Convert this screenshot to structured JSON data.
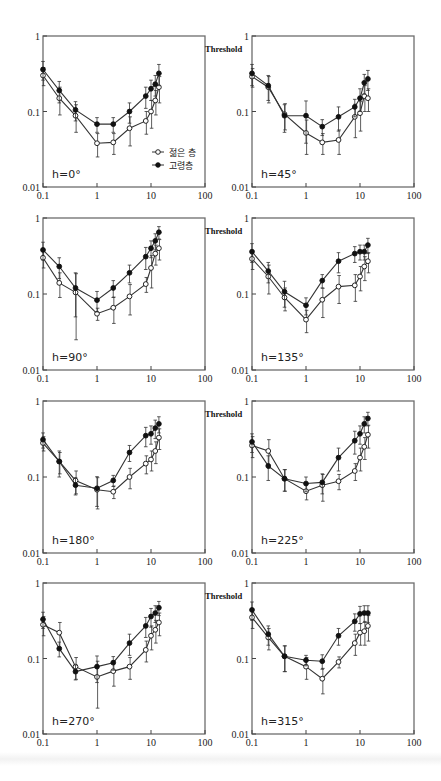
{
  "figure": {
    "legend": {
      "young_label": "젊은 층",
      "old_label": "고령층"
    },
    "y_axis_side_label": "Threshold",
    "x_tick_labels": [
      "0.1",
      "1",
      "10",
      "100"
    ],
    "y_tick_labels": [
      "0.01",
      "0.1",
      "1"
    ]
  },
  "chart_data": [
    {
      "type": "line",
      "title": "h=0°",
      "xscale": "log",
      "yscale": "log",
      "xlim": [
        0.1,
        100
      ],
      "ylim": [
        0.01,
        1
      ],
      "ylabel": "Threshold",
      "xlabel": "",
      "x": [
        0.1,
        0.2,
        0.4,
        1,
        2,
        4,
        8,
        10,
        12,
        14
      ],
      "series": [
        {
          "name": "젊은 층",
          "marker": "open-circle",
          "values": [
            0.3,
            0.15,
            0.088,
            0.038,
            0.039,
            0.06,
            0.075,
            0.1,
            0.14,
            0.21
          ],
          "err": [
            0.08,
            0.06,
            0.035,
            0.013,
            0.012,
            0.025,
            0.025,
            0.04,
            0.05,
            0.08
          ]
        },
        {
          "name": "고령층",
          "marker": "filled-circle",
          "values": [
            0.36,
            0.19,
            0.105,
            0.068,
            0.068,
            0.1,
            0.16,
            0.2,
            0.23,
            0.32
          ],
          "err": [
            0.1,
            0.06,
            0.03,
            0.015,
            0.015,
            0.03,
            0.05,
            0.06,
            0.07,
            0.1
          ]
        }
      ]
    },
    {
      "type": "line",
      "title": "h=45°",
      "xscale": "log",
      "yscale": "log",
      "xlim": [
        0.1,
        100
      ],
      "ylim": [
        0.01,
        1
      ],
      "ylabel": "Threshold",
      "xlabel": "",
      "x": [
        0.1,
        0.2,
        0.4,
        1,
        2,
        4,
        8,
        10,
        12,
        14
      ],
      "series": [
        {
          "name": "젊은 층",
          "marker": "open-circle",
          "values": [
            0.29,
            0.21,
            0.092,
            0.052,
            0.039,
            0.042,
            0.085,
            0.095,
            0.16,
            0.15
          ],
          "err": [
            0.08,
            0.08,
            0.035,
            0.025,
            0.012,
            0.015,
            0.04,
            0.04,
            0.06,
            0.05
          ]
        },
        {
          "name": "고령층",
          "marker": "filled-circle",
          "values": [
            0.32,
            0.22,
            0.088,
            0.088,
            0.063,
            0.085,
            0.115,
            0.15,
            0.24,
            0.27
          ],
          "err": [
            0.1,
            0.08,
            0.035,
            0.05,
            0.015,
            0.03,
            0.03,
            0.05,
            0.07,
            0.08
          ]
        }
      ]
    },
    {
      "type": "line",
      "title": "h=90°",
      "xscale": "log",
      "yscale": "log",
      "xlim": [
        0.1,
        100
      ],
      "ylim": [
        0.01,
        1
      ],
      "ylabel": "Threshold",
      "xlabel": "",
      "x": [
        0.1,
        0.2,
        0.4,
        1,
        2,
        4,
        8,
        10,
        12,
        14
      ],
      "series": [
        {
          "name": "젊은 층",
          "marker": "open-circle",
          "values": [
            0.3,
            0.14,
            0.105,
            0.055,
            0.066,
            0.093,
            0.135,
            0.22,
            0.34,
            0.4
          ],
          "err": [
            0.08,
            0.05,
            0.08,
            0.01,
            0.025,
            0.04,
            0.03,
            0.1,
            0.1,
            0.12
          ]
        },
        {
          "name": "고령층",
          "marker": "filled-circle",
          "values": [
            0.38,
            0.23,
            0.12,
            0.083,
            0.12,
            0.19,
            0.31,
            0.4,
            0.5,
            0.65
          ],
          "err": [
            0.1,
            0.07,
            0.07,
            0.025,
            0.03,
            0.05,
            0.1,
            0.1,
            0.12,
            0.12
          ]
        }
      ]
    },
    {
      "type": "line",
      "title": "h=135°",
      "xscale": "log",
      "yscale": "log",
      "xlim": [
        0.1,
        100
      ],
      "ylim": [
        0.01,
        1
      ],
      "ylabel": "Threshold",
      "xlabel": "",
      "x": [
        0.1,
        0.2,
        0.4,
        1,
        2,
        4,
        8,
        10,
        12,
        14
      ],
      "series": [
        {
          "name": "젊은 층",
          "marker": "open-circle",
          "values": [
            0.29,
            0.17,
            0.09,
            0.046,
            0.084,
            0.125,
            0.13,
            0.17,
            0.23,
            0.27
          ],
          "err": [
            0.08,
            0.07,
            0.03,
            0.015,
            0.035,
            0.05,
            0.05,
            0.06,
            0.08,
            0.08
          ]
        },
        {
          "name": "고령층",
          "marker": "filled-circle",
          "values": [
            0.36,
            0.2,
            0.107,
            0.071,
            0.15,
            0.27,
            0.34,
            0.36,
            0.36,
            0.44
          ],
          "err": [
            0.1,
            0.06,
            0.04,
            0.018,
            0.03,
            0.08,
            0.08,
            0.08,
            0.08,
            0.1
          ]
        }
      ]
    },
    {
      "type": "line",
      "title": "h=180°",
      "xscale": "log",
      "yscale": "log",
      "xlim": [
        0.1,
        100
      ],
      "ylim": [
        0.01,
        1
      ],
      "ylabel": "Threshold",
      "xlabel": "",
      "x": [
        0.1,
        0.2,
        0.4,
        1,
        2,
        4,
        8,
        10,
        12,
        14
      ],
      "series": [
        {
          "name": "젊은 층",
          "marker": "open-circle",
          "values": [
            0.28,
            0.16,
            0.09,
            0.068,
            0.064,
            0.1,
            0.15,
            0.17,
            0.22,
            0.33
          ],
          "err": [
            0.06,
            0.05,
            0.03,
            0.03,
            0.012,
            0.03,
            0.04,
            0.05,
            0.07,
            0.1
          ]
        },
        {
          "name": "고령층",
          "marker": "filled-circle",
          "values": [
            0.31,
            0.16,
            0.078,
            0.071,
            0.09,
            0.21,
            0.35,
            0.37,
            0.44,
            0.5
          ],
          "err": [
            0.07,
            0.06,
            0.02,
            0.03,
            0.015,
            0.05,
            0.1,
            0.1,
            0.12,
            0.12
          ]
        }
      ]
    },
    {
      "type": "line",
      "title": "h=225°",
      "xscale": "log",
      "yscale": "log",
      "xlim": [
        0.1,
        100
      ],
      "ylim": [
        0.01,
        1
      ],
      "ylabel": "Threshold",
      "xlabel": "",
      "x": [
        0.1,
        0.2,
        0.4,
        1,
        2,
        4,
        8,
        10,
        12,
        14
      ],
      "series": [
        {
          "name": "젊은 층",
          "marker": "open-circle",
          "values": [
            0.26,
            0.22,
            0.095,
            0.065,
            0.078,
            0.088,
            0.12,
            0.18,
            0.25,
            0.36
          ],
          "err": [
            0.08,
            0.09,
            0.03,
            0.015,
            0.03,
            0.02,
            0.03,
            0.06,
            0.08,
            0.12
          ]
        },
        {
          "name": "고령층",
          "marker": "filled-circle",
          "values": [
            0.29,
            0.14,
            0.095,
            0.082,
            0.085,
            0.18,
            0.3,
            0.37,
            0.5,
            0.59
          ],
          "err": [
            0.08,
            0.05,
            0.03,
            0.018,
            0.025,
            0.06,
            0.1,
            0.1,
            0.12,
            0.12
          ]
        }
      ]
    },
    {
      "type": "line",
      "title": "h=270°",
      "xscale": "log",
      "yscale": "log",
      "xlim": [
        0.1,
        100
      ],
      "ylim": [
        0.01,
        1
      ],
      "ylabel": "Threshold",
      "xlabel": "",
      "x": [
        0.1,
        0.2,
        0.4,
        1,
        2,
        4,
        8,
        10,
        12,
        14
      ],
      "series": [
        {
          "name": "젊은 층",
          "marker": "open-circle",
          "values": [
            0.28,
            0.22,
            0.078,
            0.057,
            0.068,
            0.078,
            0.13,
            0.2,
            0.24,
            0.3
          ],
          "err": [
            0.08,
            0.08,
            0.025,
            0.035,
            0.025,
            0.025,
            0.04,
            0.07,
            0.08,
            0.1
          ]
        },
        {
          "name": "고령층",
          "marker": "filled-circle",
          "values": [
            0.33,
            0.135,
            0.067,
            0.078,
            0.088,
            0.16,
            0.27,
            0.36,
            0.4,
            0.47
          ],
          "err": [
            0.08,
            0.03,
            0.015,
            0.03,
            0.018,
            0.05,
            0.08,
            0.1,
            0.1,
            0.1
          ]
        }
      ]
    },
    {
      "type": "line",
      "title": "h=315°",
      "xscale": "log",
      "yscale": "log",
      "xlim": [
        0.1,
        100
      ],
      "ylim": [
        0.01,
        1
      ],
      "ylabel": "Threshold",
      "xlabel": "",
      "x": [
        0.1,
        0.2,
        0.4,
        1,
        2,
        4,
        8,
        10,
        12,
        14
      ],
      "series": [
        {
          "name": "젊은 층",
          "marker": "open-circle",
          "values": [
            0.35,
            0.19,
            0.107,
            0.078,
            0.054,
            0.09,
            0.16,
            0.22,
            0.23,
            0.27
          ],
          "err": [
            0.1,
            0.06,
            0.04,
            0.025,
            0.02,
            0.015,
            0.05,
            0.07,
            0.08,
            0.1
          ]
        },
        {
          "name": "고령층",
          "marker": "filled-circle",
          "values": [
            0.44,
            0.21,
            0.107,
            0.095,
            0.092,
            0.2,
            0.31,
            0.39,
            0.4,
            0.4
          ],
          "err": [
            0.12,
            0.06,
            0.04,
            0.015,
            0.02,
            0.05,
            0.08,
            0.1,
            0.1,
            0.1
          ]
        }
      ]
    }
  ]
}
